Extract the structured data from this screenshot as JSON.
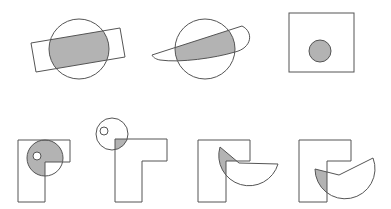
{
  "figure": {
    "colors": {
      "stroke": "#555555",
      "fill_shaded": "#b3b3b3",
      "background": "#ffffff",
      "hole": "#ffffff"
    },
    "panels": [
      {
        "id": 1,
        "label": "circle-rotated-rectangle"
      },
      {
        "id": 2,
        "label": "circle-crescent"
      },
      {
        "id": 3,
        "label": "square-inner-circle"
      },
      {
        "id": 4,
        "label": "l-shape-circle-with-hole"
      },
      {
        "id": 5,
        "label": "l-shape-circle-corner"
      },
      {
        "id": 6,
        "label": "l-shape-sector"
      },
      {
        "id": 7,
        "label": "l-shape-sector-offset"
      }
    ]
  }
}
